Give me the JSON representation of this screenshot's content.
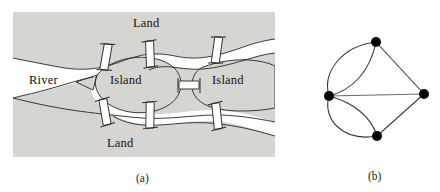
{
  "figure": {
    "panels": [
      {
        "id": "a",
        "caption": "(a)",
        "kind": "map"
      },
      {
        "id": "b",
        "caption": "(b)",
        "kind": "multigraph"
      }
    ]
  },
  "map": {
    "labels": {
      "land_top": "Land",
      "land_bottom": "Land",
      "river": "River",
      "island_left": "Island",
      "island_right": "Island"
    },
    "colors": {
      "land_fill": "#d6d5d2",
      "water_fill": "#ffffff",
      "outline": "#2a2622",
      "bridge_fill": "#ffffff",
      "text": "#15130f"
    },
    "bridge_count": 7,
    "bridges": [
      {
        "id": "bridge-top-left",
        "connects": [
          "land_top",
          "island_left"
        ]
      },
      {
        "id": "bridge-top-mid",
        "connects": [
          "land_top",
          "island_left"
        ]
      },
      {
        "id": "bridge-top-right",
        "connects": [
          "land_top",
          "island_right"
        ]
      },
      {
        "id": "bridge-middle",
        "connects": [
          "island_left",
          "island_right"
        ]
      },
      {
        "id": "bridge-bottom-left",
        "connects": [
          "land_bottom",
          "island_left"
        ]
      },
      {
        "id": "bridge-bottom-mid",
        "connects": [
          "land_bottom",
          "island_left"
        ]
      },
      {
        "id": "bridge-bottom-right",
        "connects": [
          "land_bottom",
          "island_right"
        ]
      }
    ]
  },
  "graph": {
    "colors": {
      "node_fill": "#000000",
      "edge_stroke": "#3b3b3b",
      "background": "#ffffff"
    },
    "node_radius": 5,
    "nodes": [
      {
        "id": "top",
        "label": "",
        "x": 76,
        "y": 20,
        "degree": 3
      },
      {
        "id": "left",
        "label": "",
        "x": 29,
        "y": 74,
        "degree": 5
      },
      {
        "id": "right",
        "label": "",
        "x": 124,
        "y": 72,
        "degree": 3
      },
      {
        "id": "bottom",
        "label": "",
        "x": 77,
        "y": 114,
        "degree": 3
      }
    ],
    "edges": [
      {
        "from": "left",
        "to": "top",
        "style": "curve-outer"
      },
      {
        "from": "left",
        "to": "top",
        "style": "curve-inner"
      },
      {
        "from": "left",
        "to": "bottom",
        "style": "curve-outer"
      },
      {
        "from": "left",
        "to": "bottom",
        "style": "curve-inner"
      },
      {
        "from": "left",
        "to": "right",
        "style": "straight"
      },
      {
        "from": "top",
        "to": "right",
        "style": "straight"
      },
      {
        "from": "bottom",
        "to": "right",
        "style": "straight"
      }
    ],
    "edge_count": 7
  }
}
